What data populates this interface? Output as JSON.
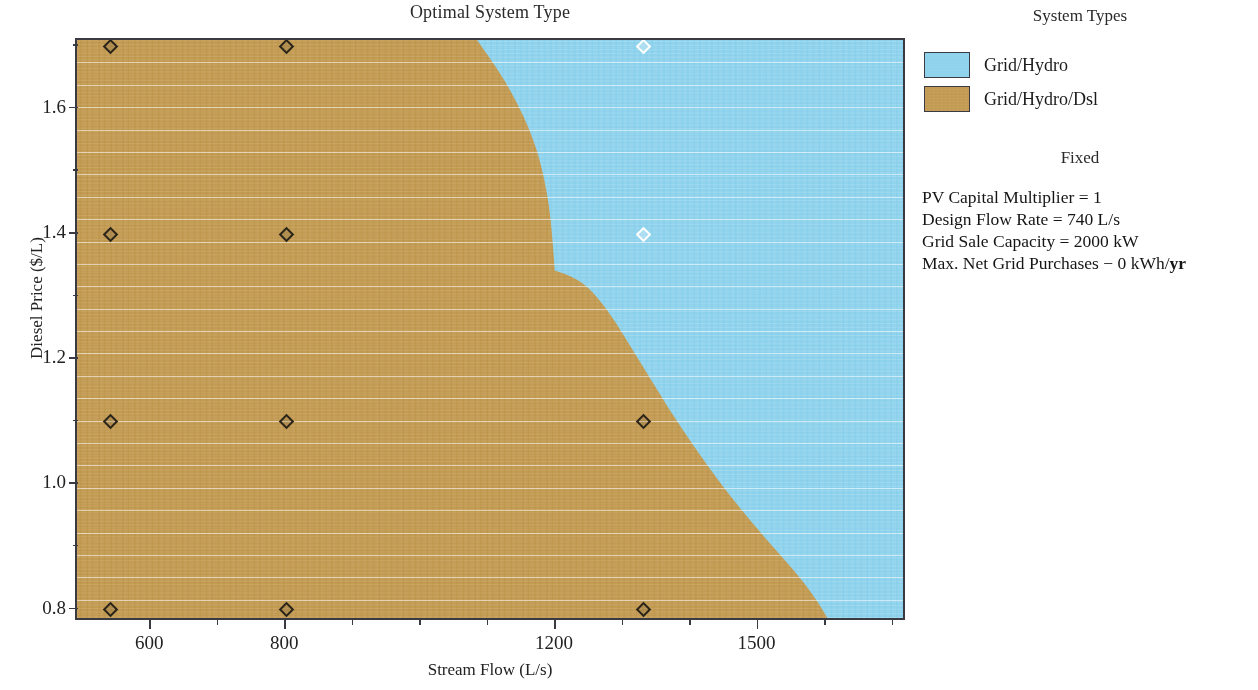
{
  "chart_data": {
    "type": "heatmap",
    "title": "Optimal System Type",
    "xlabel": "Stream Flow (L/s)",
    "ylabel": "Diesel Price ($/L)",
    "xlim": [
      490,
      1720
    ],
    "ylim": [
      0.78,
      1.71
    ],
    "grid": true,
    "legend_position": "right",
    "legend_title": "System Types",
    "categories": [
      {
        "name": "Grid/Hydro",
        "color": "#8ed2ec"
      },
      {
        "name": "Grid/Hydro/Dsl",
        "color": "#c29a52"
      }
    ],
    "x_ticks": [
      {
        "value": 600,
        "label": "600"
      },
      {
        "value": 800,
        "label": "800"
      },
      {
        "value": 1200,
        "label": "1200"
      },
      {
        "value": 1500,
        "label": "1500"
      }
    ],
    "x_minor_ticks": [
      700,
      900,
      1000,
      1100,
      1300,
      1400,
      1600,
      1700
    ],
    "y_ticks": [
      {
        "value": 0.8,
        "label": "0.8"
      },
      {
        "value": 1.0,
        "label": "1.0"
      },
      {
        "value": 1.2,
        "label": "1.2"
      },
      {
        "value": 1.4,
        "label": "1.4"
      },
      {
        "value": 1.6,
        "label": "1.6"
      }
    ],
    "y_minor_ticks": [
      0.9,
      1.1,
      1.3,
      1.5,
      1.7
    ],
    "boundary_curve": {
      "description": "Boundary between Grid/Hydro/Dsl (left) and Grid/Hydro (right)",
      "points": [
        {
          "x": 1085,
          "y": 1.71
        },
        {
          "x": 1110,
          "y": 1.64
        },
        {
          "x": 1150,
          "y": 1.52
        },
        {
          "x": 1185,
          "y": 1.42
        },
        {
          "x": 1205,
          "y": 1.34
        },
        {
          "x": 1215,
          "y": 1.27
        },
        {
          "x": 1222,
          "y": 1.22
        },
        {
          "x": 1275,
          "y": 1.205
        },
        {
          "x": 1300,
          "y": 1.17
        },
        {
          "x": 1330,
          "y": 1.11
        },
        {
          "x": 1375,
          "y": 1.03
        },
        {
          "x": 1430,
          "y": 0.95
        },
        {
          "x": 1490,
          "y": 0.87
        },
        {
          "x": 1540,
          "y": 0.8
        }
      ]
    },
    "sample_points": [
      {
        "x": 540,
        "y": 1.7,
        "category": "Grid/Hydro/Dsl"
      },
      {
        "x": 800,
        "y": 1.7,
        "category": "Grid/Hydro/Dsl"
      },
      {
        "x": 1330,
        "y": 1.7,
        "category": "Grid/Hydro"
      },
      {
        "x": 540,
        "y": 1.4,
        "category": "Grid/Hydro/Dsl"
      },
      {
        "x": 800,
        "y": 1.4,
        "category": "Grid/Hydro/Dsl"
      },
      {
        "x": 1330,
        "y": 1.4,
        "category": "Grid/Hydro"
      },
      {
        "x": 540,
        "y": 1.1,
        "category": "Grid/Hydro/Dsl"
      },
      {
        "x": 800,
        "y": 1.1,
        "category": "Grid/Hydro/Dsl"
      },
      {
        "x": 1330,
        "y": 1.1,
        "category": "Grid/Hydro/Dsl"
      },
      {
        "x": 540,
        "y": 0.8,
        "category": "Grid/Hydro/Dsl"
      },
      {
        "x": 800,
        "y": 0.8,
        "category": "Grid/Hydro/Dsl"
      },
      {
        "x": 1330,
        "y": 0.8,
        "category": "Grid/Hydro/Dsl"
      }
    ]
  },
  "header": {
    "title": "Optimal System Type"
  },
  "axes": {
    "x_title": "Stream Flow (L/s)",
    "y_title": "Diesel Price ($/L)",
    "x_tick_labels": [
      "600",
      "800",
      "1200",
      "1500"
    ],
    "y_tick_labels": [
      "0.8",
      "1.0",
      "1.2",
      "1.4",
      "1.6"
    ]
  },
  "legend": {
    "title": "System Types",
    "items": [
      {
        "label": "Grid/Hydro",
        "color": "#8ed2ec"
      },
      {
        "label": "Grid/Hydro/Dsl",
        "color": "#c29a52"
      }
    ]
  },
  "fixed": {
    "title": "Fixed",
    "lines": [
      "PV Capital Multiplier = 1",
      "Design Flow Rate = 740 L/s",
      "Grid Sale Capacity = 2000 kW"
    ],
    "last_line_prefix": "Max. Net Grid Purchases − 0 kWh/",
    "last_line_bold": "yr"
  }
}
